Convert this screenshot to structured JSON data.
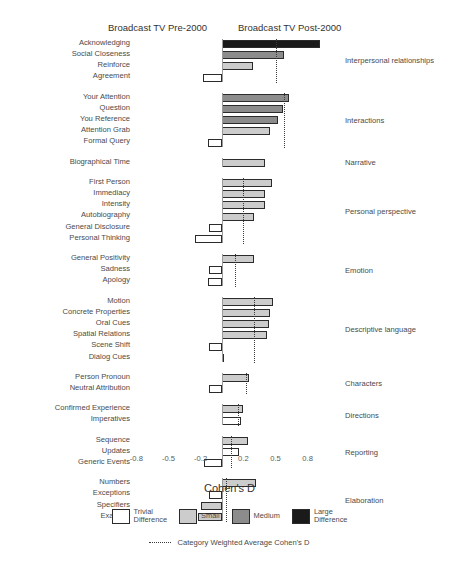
{
  "header": {
    "left_label": "Broadcast TV Pre-2000",
    "right_label": "Broadcast TV Post-2000"
  },
  "axis": {
    "title": "Cohen's D",
    "ticks": [
      -0.8,
      -0.5,
      -0.2,
      0.2,
      0.5,
      0.8
    ],
    "tick_labels": [
      "-0.8",
      "-0.5",
      "-0.2",
      "0.2",
      "0.5",
      "0.8"
    ],
    "xlim": [
      -1.0,
      1.05
    ]
  },
  "legend": {
    "items": [
      {
        "key": "trivial",
        "label": "Trivial\nDifference",
        "color": "#ffffff"
      },
      {
        "key": "small",
        "label": "Small",
        "color": "#cccccc"
      },
      {
        "key": "medium",
        "label": "Medium",
        "color": "#8c8c8c"
      },
      {
        "key": "large",
        "label": "Large\nDifference",
        "color": "#1a1a1a"
      }
    ],
    "average_line_label": "Category Weighted Average Cohen's D"
  },
  "chart_data": {
    "type": "bar",
    "orientation": "horizontal",
    "title": "",
    "xlabel": "Cohen's D",
    "ylabel": "",
    "xlim": [
      -1.0,
      1.05
    ],
    "grid": false,
    "legend_position": "bottom",
    "value_key": "Cohen's D",
    "effect_sizes": [
      "trivial",
      "small",
      "medium",
      "large"
    ],
    "groups": [
      {
        "name": "Interpersonal relationships",
        "weighted_average": 0.5,
        "bars": [
          {
            "label": "Acknowledging",
            "value": 0.92,
            "effect": "large"
          },
          {
            "label": "Social Closeness",
            "value": 0.58,
            "effect": "medium"
          },
          {
            "label": "Reinforce",
            "value": 0.29,
            "effect": "small"
          },
          {
            "label": "Agreement",
            "value": -0.18,
            "effect": "trivial"
          }
        ]
      },
      {
        "name": "Interactions",
        "weighted_average": 0.58,
        "bars": [
          {
            "label": "Your Attention",
            "value": 0.63,
            "effect": "medium"
          },
          {
            "label": "Question",
            "value": 0.57,
            "effect": "medium"
          },
          {
            "label": "You Reference",
            "value": 0.52,
            "effect": "medium"
          },
          {
            "label": "Attention Grab",
            "value": 0.45,
            "effect": "small"
          },
          {
            "label": "Formal Query",
            "value": -0.13,
            "effect": "trivial"
          }
        ]
      },
      {
        "name": "Narrative",
        "weighted_average": null,
        "bars": [
          {
            "label": "Biographical Time",
            "value": 0.4,
            "effect": "small"
          }
        ]
      },
      {
        "name": "Personal perspective",
        "weighted_average": 0.2,
        "bars": [
          {
            "label": "First Person",
            "value": 0.47,
            "effect": "small"
          },
          {
            "label": "Immediacy",
            "value": 0.4,
            "effect": "small"
          },
          {
            "label": "Intensity",
            "value": 0.4,
            "effect": "small"
          },
          {
            "label": "Autobiography",
            "value": 0.3,
            "effect": "small"
          },
          {
            "label": "General Disclosure",
            "value": -0.12,
            "effect": "trivial"
          },
          {
            "label": "Personal Thinking",
            "value": -0.25,
            "effect": "trivial"
          }
        ]
      },
      {
        "name": "Emotion",
        "weighted_average": 0.12,
        "bars": [
          {
            "label": "General Positivity",
            "value": 0.3,
            "effect": "small"
          },
          {
            "label": "Sadness",
            "value": -0.12,
            "effect": "trivial"
          },
          {
            "label": "Apology",
            "value": -0.13,
            "effect": "trivial"
          }
        ]
      },
      {
        "name": "Descriptive language",
        "weighted_average": 0.3,
        "bars": [
          {
            "label": "Motion",
            "value": 0.48,
            "effect": "small"
          },
          {
            "label": "Concrete Properties",
            "value": 0.45,
            "effect": "small"
          },
          {
            "label": "Oral Cues",
            "value": 0.44,
            "effect": "small"
          },
          {
            "label": "Spatial Relations",
            "value": 0.42,
            "effect": "small"
          },
          {
            "label": "Scene Shift",
            "value": -0.12,
            "effect": "trivial"
          },
          {
            "label": "Dialog Cues",
            "value": 0.0,
            "effect": "trivial"
          }
        ]
      },
      {
        "name": "Characters",
        "weighted_average": 0.22,
        "bars": [
          {
            "label": "Person Pronoun",
            "value": 0.25,
            "effect": "small"
          },
          {
            "label": "Neutral Attribution",
            "value": -0.12,
            "effect": "trivial"
          }
        ]
      },
      {
        "name": "Directions",
        "weighted_average": 0.15,
        "bars": [
          {
            "label": "Confirmed Experience",
            "value": 0.2,
            "effect": "small"
          },
          {
            "label": "Imperatives",
            "value": 0.18,
            "effect": "trivial"
          }
        ]
      },
      {
        "name": "Reporting",
        "weighted_average": 0.08,
        "bars": [
          {
            "label": "Sequence",
            "value": 0.24,
            "effect": "small"
          },
          {
            "label": "Updates",
            "value": 0.16,
            "effect": "trivial"
          },
          {
            "label": "Generic Events",
            "value": -0.17,
            "effect": "trivial"
          }
        ]
      },
      {
        "name": "Elaboration",
        "weighted_average": 0.04,
        "bars": [
          {
            "label": "Numbers",
            "value": 0.32,
            "effect": "small"
          },
          {
            "label": "Exceptions",
            "value": -0.12,
            "effect": "trivial"
          },
          {
            "label": "Specifiers",
            "value": -0.2,
            "effect": "small"
          },
          {
            "label": "Example",
            "value": -0.22,
            "effect": "small"
          }
        ]
      }
    ]
  }
}
